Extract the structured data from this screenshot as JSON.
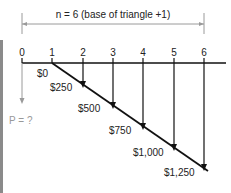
{
  "diagram": {
    "span_label": "n = 6 (base of triangle +1)",
    "periods": [
      "0",
      "1",
      "2",
      "3",
      "4",
      "5",
      "6"
    ],
    "cash_flows": [
      "$0",
      "$250",
      "$500",
      "$750",
      "$1,000",
      "$1,250"
    ],
    "present_value_label": "P = ?",
    "colors": {
      "line": "#111111",
      "dimension": "#9a9a9a",
      "leftbar": "#8a8a8a"
    }
  }
}
